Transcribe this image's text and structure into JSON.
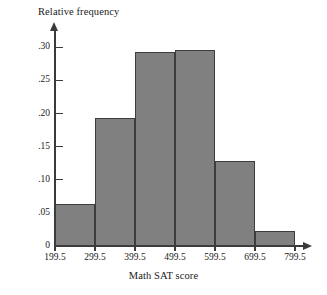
{
  "chart_data": {
    "type": "bar",
    "title": "",
    "xlabel": "Math SAT score",
    "ylabel": "Relative frequency",
    "categories": [
      "199.5-299.5",
      "299.5-399.5",
      "399.5-499.5",
      "499.5-599.5",
      "599.5-699.5",
      "699.5-799.5"
    ],
    "values": [
      0.063,
      0.193,
      0.293,
      0.296,
      0.128,
      0.022
    ],
    "bin_edges": [
      199.5,
      299.5,
      399.5,
      499.5,
      599.5,
      699.5,
      799.5
    ],
    "xtick_labels": [
      "199.5",
      "299.5",
      "399.5",
      "499.5",
      "599.5",
      "699.5",
      "799.5"
    ],
    "ytick_labels": [
      "0",
      ".05",
      ".10",
      ".15",
      ".20",
      ".25",
      ".30"
    ],
    "ytick_values": [
      0,
      0.05,
      0.1,
      0.15,
      0.2,
      0.25,
      0.3
    ],
    "ylim": [
      0,
      0.32
    ],
    "xlim": [
      199.5,
      799.5
    ],
    "grid": false,
    "legend": "none",
    "bar_fill_color": "#808080",
    "bar_edge_color": "#3d3d3d",
    "axis_color": "#3a3a3a"
  }
}
